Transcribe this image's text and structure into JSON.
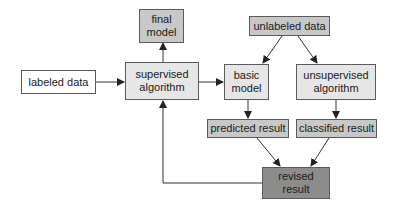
{
  "colors": {
    "white": "#ffffff",
    "light": "#e6e6e6",
    "mid": "#c8c8c8",
    "dark": "#8c8c8c",
    "line": "#333333"
  },
  "nodes": {
    "labeled_data": {
      "label": "labeled data"
    },
    "final_model": {
      "label": "final\nmodel"
    },
    "supervised_algorithm": {
      "label": "supervised\nalgorithm"
    },
    "unlabeled_data": {
      "label": "unlabeled data"
    },
    "basic_model": {
      "label": "basic\nmodel"
    },
    "unsupervised_algorithm": {
      "label": "unsupervised\nalgorithm"
    },
    "predicted_result": {
      "label": "predicted result"
    },
    "classified_result": {
      "label": "classified result"
    },
    "revised_result": {
      "label": "revised\nresult"
    }
  },
  "edges": [
    {
      "from": "labeled data",
      "to": "supervised algorithm"
    },
    {
      "from": "supervised algorithm",
      "to": "final model"
    },
    {
      "from": "supervised algorithm",
      "to": "basic model"
    },
    {
      "from": "unlabeled data",
      "to": "basic model"
    },
    {
      "from": "unlabeled data",
      "to": "unsupervised algorithm"
    },
    {
      "from": "basic model",
      "to": "predicted result"
    },
    {
      "from": "unsupervised algorithm",
      "to": "classified result"
    },
    {
      "from": "predicted result",
      "to": "revised result"
    },
    {
      "from": "classified result",
      "to": "revised result"
    },
    {
      "from": "revised result",
      "to": "supervised algorithm"
    }
  ]
}
